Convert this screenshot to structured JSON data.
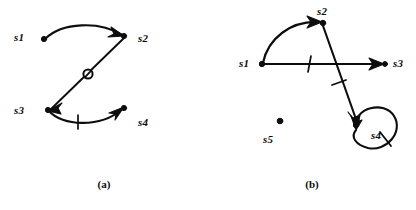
{
  "figure": {
    "background_color": "#ffffff",
    "ink_color": "#0d0d0d",
    "width": 416,
    "height": 210
  },
  "panel_a": {
    "caption": "(a)",
    "nodes": [
      {
        "id": "s1",
        "label": "s1",
        "label_x": 14,
        "label_y": 32,
        "dot_x": 44,
        "dot_y": 39,
        "dot_visible": true
      },
      {
        "id": "s2",
        "label": "s2",
        "label_x": 138,
        "label_y": 33,
        "dot_x": 125,
        "dot_y": 36,
        "dot_visible": true
      },
      {
        "id": "s3",
        "label": "s3",
        "label_x": 14,
        "label_y": 105,
        "dot_x": 48,
        "dot_y": 110,
        "dot_visible": true
      },
      {
        "id": "s4",
        "label": "s4",
        "label_x": 138,
        "label_y": 117,
        "dot_x": 124,
        "dot_y": 108,
        "dot_visible": true
      }
    ],
    "edges": [
      {
        "from": "s1",
        "to": "s2",
        "shape": "arc-up",
        "arrowhead": true,
        "tick": false,
        "circle_marker": false
      },
      {
        "from": "s2",
        "to": "s3",
        "shape": "straight-diagonal",
        "arrowhead": true,
        "tick": false,
        "circle_marker": true
      },
      {
        "from": "s3",
        "to": "s4",
        "shape": "arc-down",
        "arrowhead": true,
        "tick": true,
        "circle_marker": false
      }
    ],
    "markers": {
      "circle_slash": {
        "x": 88,
        "y": 74,
        "radius": 4.6
      },
      "tick": {
        "x": 78,
        "y": 122
      }
    }
  },
  "panel_b": {
    "caption": "(b)",
    "nodes": [
      {
        "id": "s1",
        "label": "s1",
        "label_x": 31,
        "label_y": 58,
        "dot_x": 54,
        "dot_y": 64,
        "dot_visible": true
      },
      {
        "id": "s2",
        "label": "s2",
        "label_x": 109,
        "label_y": 7,
        "dot_x": 113,
        "dot_y": 22,
        "dot_visible": true
      },
      {
        "id": "s3",
        "label": "s3",
        "label_x": 184,
        "label_y": 58,
        "dot_x": 175,
        "dot_y": 64,
        "dot_visible": true
      },
      {
        "id": "s4",
        "label": "s4",
        "label_x": 163,
        "label_y": 131,
        "dot_x": 148,
        "dot_y": 124,
        "dot_visible": true
      },
      {
        "id": "s5",
        "label": "s5",
        "label_x": 55,
        "label_y": 135,
        "dot_x": 72,
        "dot_y": 121,
        "dot_visible": true
      }
    ],
    "edges": [
      {
        "from": "s1",
        "to": "s2",
        "shape": "arc-up-left",
        "arrowhead": true,
        "tick": false
      },
      {
        "from": "s1",
        "to": "s3",
        "shape": "straight-horizontal",
        "arrowhead": true,
        "tick": true
      },
      {
        "from": "s2",
        "to": "s4",
        "shape": "straight-diagonal-down",
        "arrowhead": true,
        "tick": true
      },
      {
        "from": "s4",
        "to": "s4",
        "shape": "self-loop",
        "arrowhead": true,
        "tick": true
      }
    ],
    "markers": {
      "tick_horizontal": {
        "x": 102,
        "y": 64
      },
      "tick_diagonal": {
        "x": 131,
        "y": 89
      },
      "tick_loop": {
        "x": 172,
        "y": 136
      }
    },
    "isolated_nodes": [
      "s5"
    ]
  }
}
